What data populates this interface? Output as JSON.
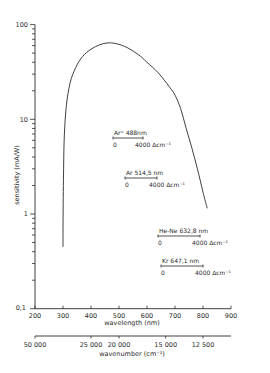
{
  "chart_data": {
    "type": "line",
    "title": "",
    "xlabel": "wavelength (nm)",
    "ylabel": "sensitivity (mA/W)",
    "secondary_xlabel": "wavenumber (cm⁻¹)",
    "yscale": "log",
    "xlim": [
      200,
      900
    ],
    "ylim": [
      0.1,
      100
    ],
    "grid": false,
    "x_ticks": [
      200,
      300,
      400,
      500,
      600,
      700,
      800,
      900
    ],
    "x_tick_labels": [
      "200",
      "300",
      "400",
      "500",
      "600",
      "700",
      "800",
      "900"
    ],
    "y_ticks": [
      0.1,
      1,
      10,
      100
    ],
    "y_tick_labels": [
      "0,1",
      "1",
      "10",
      "100"
    ],
    "secondary_x_ticks": [
      {
        "label": "50 000",
        "wavelength": 200
      },
      {
        "label": "25 000",
        "wavelength": 400
      },
      {
        "label": "20 000",
        "wavelength": 500
      },
      {
        "label": "15 000",
        "wavelength": 666.7
      },
      {
        "label": "12 500",
        "wavelength": 800
      }
    ],
    "series": [
      {
        "name": "sensitivity",
        "x": [
          300,
          300.5,
          302,
          305,
          312,
          325,
          345,
          370,
          400,
          430,
          457,
          490,
          530,
          570,
          600,
          640,
          680,
          700,
          720,
          740,
          760,
          780,
          800,
          815
        ],
        "y": [
          0.45,
          1.0,
          3.0,
          7.0,
          14.0,
          24.0,
          35.0,
          46.0,
          55.0,
          61.0,
          64.0,
          63.0,
          57.0,
          48.0,
          40.0,
          31.0,
          22.0,
          18.0,
          13.0,
          8.0,
          5.0,
          3.0,
          1.7,
          1.15
        ]
      }
    ],
    "annotations": [
      {
        "label": "Ar⁺",
        "wavelength_label": "488nm",
        "start": "0",
        "end": "4000",
        "unit": "Δcm⁻¹"
      },
      {
        "label": "Ar",
        "wavelength_label": "514,5 nm",
        "start": "0",
        "end": "4000",
        "unit": "Δcm⁻¹"
      },
      {
        "label": "He-Ne",
        "wavelength_label": "632,8 nm",
        "start": "0",
        "end": "4000",
        "unit": "Δcm⁻¹"
      },
      {
        "label": "Kr",
        "wavelength_label": "647,1 nm",
        "start": "0",
        "end": "4000",
        "unit": "Δcm⁻¹"
      }
    ]
  },
  "axes": {
    "x_title": "wavelength (nm)",
    "x2_title": "wavenumber (cm⁻¹)",
    "y_title": "sensitivity (mA/W)"
  },
  "colors": {
    "ink": "#2a2a2a",
    "background": "#ffffff"
  }
}
